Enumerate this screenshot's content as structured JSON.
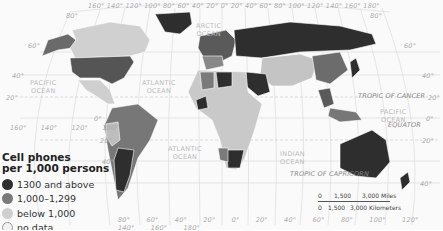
{
  "map": {
    "title": "Cell phones per 1,000 persons",
    "legend": {
      "title_line1": "Cell phones",
      "title_line2": "per 1,000 persons",
      "items": [
        {
          "label": "1300 and above",
          "color": "#2e2e2e"
        },
        {
          "label": "1,000–1,299",
          "color": "#7a7a7a"
        },
        {
          "label": "below 1,000",
          "color": "#cfcfcf"
        },
        {
          "label": "no data",
          "color": "#f2f2f2"
        }
      ]
    },
    "oceans": {
      "arctic": "ARCTIC\nOCEAN",
      "pacific_north_west": "PACIFIC\nOCEAN",
      "atlantic_north": "ATLANTIC\nOCEAN",
      "atlantic_south": "ATLANTIC\nOCEAN",
      "indian": "INDIAN\nOCEAN",
      "pacific_east": "PACIFIC\nOCEAN"
    },
    "lines": {
      "tropic_cancer": "TROPIC OF CANCER",
      "tropic_capricorn": "TROPIC OF CAPRICORN",
      "equator": "EQUATOR"
    },
    "top_longitudes": [
      "160°",
      "140°",
      "120°",
      "100°",
      "80°",
      "60°",
      "40°",
      "20°",
      "0°",
      "20°",
      "40°",
      "60°",
      "80°",
      "100°",
      "120°",
      "140°",
      "160°",
      "180°"
    ],
    "bottom_longitudes": [
      "80°",
      "60°",
      "40°",
      "20°",
      "0°",
      "20°",
      "40°",
      "60°",
      "80°",
      "100°",
      "120°",
      "140°",
      "160°",
      "180°"
    ],
    "mid_longitudes": [
      "160°",
      "140°",
      "120°",
      "100°"
    ],
    "left_latitudes": [
      "60°",
      "40°",
      "20°",
      "0°",
      "20°",
      "40°"
    ],
    "right_latitudes": [
      "60°",
      "40°",
      "20°",
      "0°",
      "20°",
      "40°"
    ],
    "top_lat": [
      "80°",
      "80°"
    ],
    "scale": {
      "miles": [
        "0",
        "1,500",
        "3,000 Miles"
      ],
      "km": [
        "0",
        "1,500",
        "3,000 Kilometers"
      ]
    }
  }
}
